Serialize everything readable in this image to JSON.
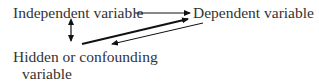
{
  "diagram": {
    "nodes": [
      {
        "id": "independent",
        "label": "Independent variable"
      },
      {
        "id": "dependent",
        "label": "Dependent variable"
      },
      {
        "id": "hidden",
        "label_line1": "Hidden or confounding",
        "label_line2": "variable"
      }
    ],
    "edges": [
      {
        "from": "independent",
        "to": "dependent",
        "style": "thin",
        "type": "directed"
      },
      {
        "from": "independent",
        "to": "hidden",
        "style": "thin",
        "type": "bidirectional"
      },
      {
        "from": "hidden",
        "to": "dependent",
        "style": "thick",
        "type": "directed"
      },
      {
        "from": "dependent",
        "to": "hidden",
        "style": "thin",
        "type": "directed"
      }
    ],
    "colors": {
      "text": "#333333",
      "line": "#111111",
      "background": "#ffffff"
    }
  }
}
